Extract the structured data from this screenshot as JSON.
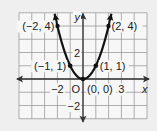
{
  "chart_data": {
    "type": "line",
    "title": "",
    "function": "y = x^2",
    "xlabel": "x",
    "ylabel": "y",
    "xlim": [
      -5,
      5
    ],
    "ylim": [
      -3,
      5
    ],
    "grid": true,
    "origin_label": "O",
    "x_tick_labels": [
      {
        "value": -2,
        "text": "−2"
      },
      {
        "value": 3,
        "text": "3"
      }
    ],
    "y_tick_labels": [
      {
        "value": 2,
        "text": "2"
      },
      {
        "value": -2,
        "text": "−2"
      }
    ],
    "series": [
      {
        "name": "parabola",
        "color": "#111111",
        "x": [
          -2,
          -1,
          0,
          1,
          2
        ],
        "y": [
          4,
          1,
          0,
          1,
          4
        ],
        "arrows_at_ends": true
      }
    ],
    "points": [
      {
        "x": -2,
        "y": 4,
        "label": "(−2, 4)"
      },
      {
        "x": -1,
        "y": 1,
        "label": "(−1, 1)"
      },
      {
        "x": 0,
        "y": 0,
        "label": "(0, 0)"
      },
      {
        "x": 1,
        "y": 1,
        "label": "(1, 1)"
      },
      {
        "x": 2,
        "y": 4,
        "label": "(2, 4)"
      }
    ]
  },
  "colors": {
    "background": "#efefef",
    "grid_fill": "#f7f7f7",
    "grid_line": "#9a9a9a",
    "axis": "#333333",
    "curve": "#111111"
  }
}
